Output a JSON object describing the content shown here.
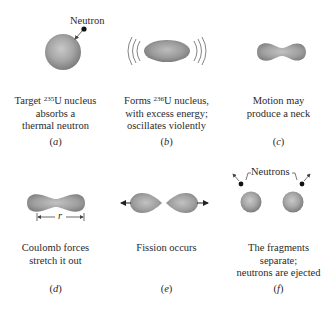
{
  "panels": [
    {
      "id": "a",
      "label": "a",
      "caption": {
        "line1_pre": "Target ",
        "isotope_mass": "235",
        "line1_post": "U nucleus",
        "line2": "absorbs a",
        "line3": "thermal neutron"
      },
      "annotation": "Neutron"
    },
    {
      "id": "b",
      "label": "b",
      "caption": {
        "line1_pre": "Forms ",
        "isotope_mass": "236",
        "line1_post": "U nucleus,",
        "line2": "with excess energy;",
        "line3": "oscillates violently"
      }
    },
    {
      "id": "c",
      "label": "c",
      "caption": {
        "line1": "Motion may",
        "line2": "produce a neck"
      }
    },
    {
      "id": "d",
      "label": "d",
      "caption": {
        "line1": "Coulomb forces",
        "line2": "stretch it out"
      },
      "dimension_label": "r"
    },
    {
      "id": "e",
      "label": "e",
      "caption": {
        "line1": "Fission occurs"
      }
    },
    {
      "id": "f",
      "label": "f",
      "caption": {
        "line1": "The fragments",
        "line2": "separate;",
        "line3": "neutrons are ejected"
      },
      "annotation": "Neutrons"
    }
  ],
  "colors": {
    "nucleus_light": "#c4c4c4",
    "nucleus_dark": "#7d7d7d",
    "neutron": "#111111",
    "text": "#2a2a2a"
  }
}
